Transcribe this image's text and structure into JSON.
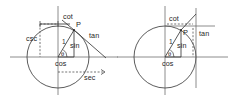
{
  "figure": {
    "background_color": "#ffffff",
    "line_color": "#3a3a3a",
    "axis_color": "#6e6e6e",
    "width": 233,
    "height": 97,
    "panels": [
      {
        "id": "left-panel",
        "name": "unit-circle-diagram-left",
        "description": "Unit circle with radius to point P showing sin, cos, tan, cot, sec, csc segments",
        "center": {
          "x": 58,
          "y": 57
        },
        "radius": 31,
        "point_P": {
          "x": 74,
          "y": 30,
          "label": "P"
        },
        "angle_label": "θ",
        "radius_label": "1",
        "labels": [
          {
            "key": "cot",
            "text": "cot",
            "x": 63,
            "y": 19
          },
          {
            "key": "csc",
            "text": "csc",
            "x": 28,
            "y": 38
          },
          {
            "key": "P",
            "text": "P",
            "x": 76,
            "y": 25
          },
          {
            "key": "tan",
            "text": "tan",
            "x": 91,
            "y": 37
          },
          {
            "key": "one",
            "text": "1",
            "x": 60,
            "y": 43
          },
          {
            "key": "sin",
            "text": "sin",
            "x": 74,
            "y": 46
          },
          {
            "key": "cos",
            "text": "cos",
            "x": 58,
            "y": 65
          },
          {
            "key": "theta",
            "text": "θ",
            "x": 62,
            "y": 55
          },
          {
            "key": "sec",
            "text": "sec",
            "x": 88,
            "y": 76
          }
        ]
      },
      {
        "id": "right-panel",
        "name": "unit-circle-diagram-right",
        "description": "Unit circle with radius to point P showing sin, cos, tan, cot segments only",
        "center": {
          "x": 165,
          "y": 57
        },
        "radius": 31,
        "point_P": {
          "x": 181,
          "y": 30,
          "label": "P"
        },
        "angle_label": "θ",
        "radius_label": "1",
        "labels": [
          {
            "key": "cot",
            "text": "cot",
            "x": 171,
            "y": 19
          },
          {
            "key": "P",
            "text": "P",
            "x": 183,
            "y": 33
          },
          {
            "key": "tan",
            "text": "tan",
            "x": 200,
            "y": 35
          },
          {
            "key": "one",
            "text": "1",
            "x": 167,
            "y": 43
          },
          {
            "key": "sin",
            "text": "sin",
            "x": 181,
            "y": 46
          },
          {
            "key": "cos",
            "text": "cos",
            "x": 165,
            "y": 65
          },
          {
            "key": "theta",
            "text": "θ",
            "x": 169,
            "y": 55
          }
        ]
      }
    ]
  }
}
